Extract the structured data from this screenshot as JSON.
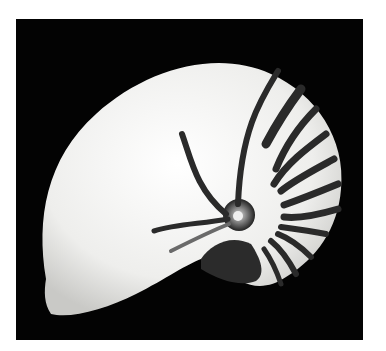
{
  "image": {
    "subject": "nautilus-shell",
    "description": "Black and white photograph of a chambered nautilus shell with dark tiger stripes on a black background",
    "colors": {
      "background": "#030303",
      "border": "#ffffff",
      "shell": "#f2f2f0",
      "stripes": "#2a2a2a"
    }
  }
}
